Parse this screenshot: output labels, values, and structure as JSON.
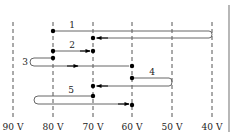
{
  "diagram": {
    "title": "",
    "axis_labels": [
      "90 V",
      "80 V",
      "70 V",
      "60 V",
      "50 V",
      "40 V"
    ],
    "path_labels": [
      "1",
      "2",
      "3",
      "4",
      "5"
    ],
    "colors": {
      "line": "#555555",
      "dash": "#555555",
      "dot": "#000000",
      "border": "#888888"
    }
  },
  "paths": [
    {
      "label": "1",
      "from": "80 V",
      "to": "70 V",
      "turnaround": "40 V"
    },
    {
      "label": "2",
      "from": "80 V",
      "to": "70 V",
      "turnaround": null
    },
    {
      "label": "3",
      "from": "80 V",
      "to": "60 V",
      "turnaround": "left of 90 V region"
    },
    {
      "label": "4",
      "from": "60 V",
      "to": "70 V",
      "turnaround": "50 V"
    },
    {
      "label": "5",
      "from": "70 V",
      "to": "60 V",
      "turnaround": "left of 80 V region"
    }
  ]
}
